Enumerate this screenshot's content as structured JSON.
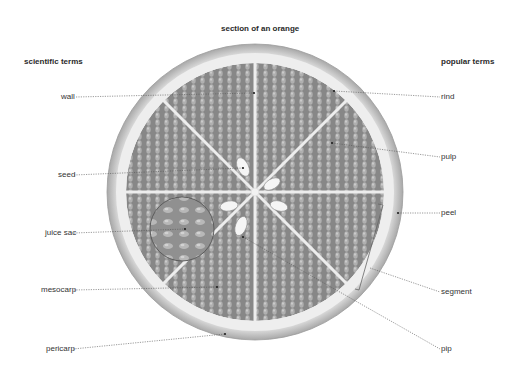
{
  "title": "section of an orange",
  "headers": {
    "left": "scientific terms",
    "right": "popular terms"
  },
  "labels": {
    "left": [
      {
        "id": "wall",
        "text": "wall"
      },
      {
        "id": "seed",
        "text": "seed"
      },
      {
        "id": "juice-sac",
        "text": "juice sac"
      },
      {
        "id": "mesocarp",
        "text": "mesocarp"
      },
      {
        "id": "pericarp",
        "text": "pericarp"
      }
    ],
    "right": [
      {
        "id": "rind",
        "text": "rind"
      },
      {
        "id": "pulp",
        "text": "pulp"
      },
      {
        "id": "peel",
        "text": "peel"
      },
      {
        "id": "segment",
        "text": "segment"
      },
      {
        "id": "pip",
        "text": "pip"
      }
    ]
  },
  "colors": {
    "background": "#ffffff",
    "rind": "#d9d9d9",
    "rind_inner": "#f0f0f0",
    "pulp": "#8a8a8a",
    "juice_sac": "#b5b5b5",
    "seed": "#f4f4f4",
    "leader_line": "#555555",
    "text": "#333333"
  }
}
